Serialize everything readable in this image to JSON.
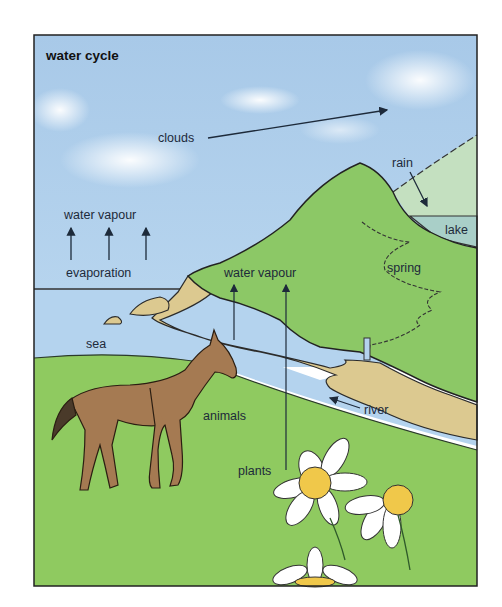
{
  "diagram": {
    "title": "water cycle",
    "labels": {
      "clouds": "clouds",
      "rain": "rain",
      "lake": "lake",
      "water_vapour_sea": "water vapour",
      "evaporation": "evaporation",
      "water_vapour_land": "water vapour",
      "spring": "spring",
      "sea": "sea",
      "animals": "animals",
      "river": "river",
      "plants": "plants"
    },
    "colors": {
      "sky": "#a9cbe8",
      "sea": "#b4d3ee",
      "hill": "#8cc866",
      "grass": "#8fca60",
      "sand": "#dcc990",
      "lake": "#a9cfc8",
      "rain_area": "#c4e0c0",
      "horse": "#a57a52",
      "daisy_center": "#f0c84a",
      "outline": "#1f2a1f"
    }
  }
}
